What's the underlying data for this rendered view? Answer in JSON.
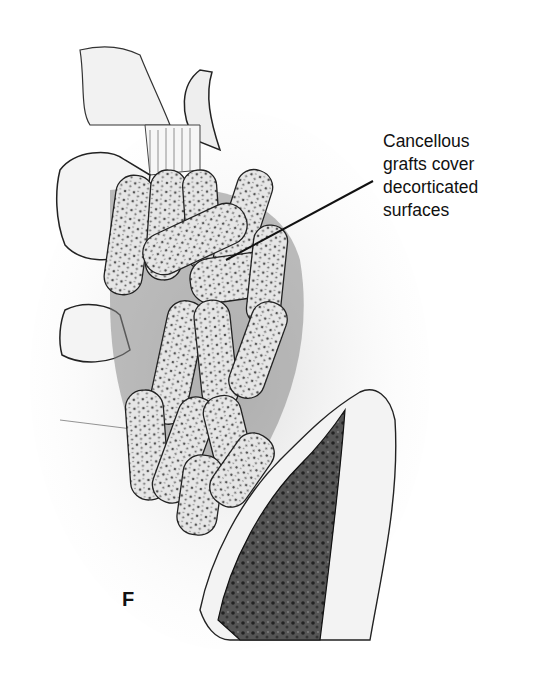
{
  "figure": {
    "panel_label": "F",
    "annotation": {
      "lines": [
        "Cancellous",
        "grafts cover",
        "decorticated",
        "surfaces"
      ]
    },
    "colors": {
      "ink": "#111111",
      "background": "#ffffff",
      "shade": "#8a8a8a"
    }
  }
}
